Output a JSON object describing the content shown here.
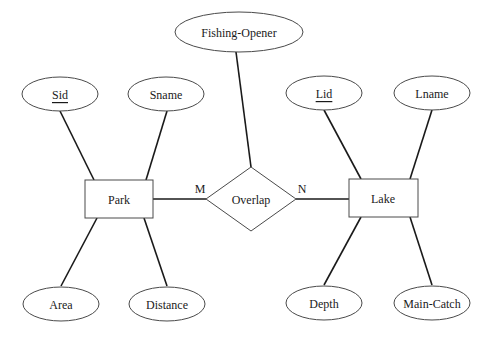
{
  "diagram": {
    "type": "er-diagram",
    "entities": [
      {
        "id": "park",
        "label": "Park"
      },
      {
        "id": "lake",
        "label": "Lake"
      }
    ],
    "relationships": [
      {
        "id": "overlap",
        "label": "Overlap",
        "left_cardinality": "M",
        "right_cardinality": "N"
      }
    ],
    "attributes": {
      "fishing_opener": {
        "label": "Fishing-Opener",
        "owner": "overlap",
        "key": false
      },
      "sid": {
        "label": "Sid",
        "owner": "park",
        "key": true
      },
      "sname": {
        "label": "Sname",
        "owner": "park",
        "key": false
      },
      "area": {
        "label": "Area",
        "owner": "park",
        "key": false
      },
      "distance": {
        "label": "Distance",
        "owner": "park",
        "key": false
      },
      "lid": {
        "label": "Lid",
        "owner": "lake",
        "key": true
      },
      "lname": {
        "label": "Lname",
        "owner": "lake",
        "key": false
      },
      "depth": {
        "label": "Depth",
        "owner": "lake",
        "key": false
      },
      "main_catch": {
        "label": "Main-Catch",
        "owner": "lake",
        "key": false
      }
    },
    "colors": {
      "stroke": "#4a4a4a",
      "text": "#1a1a1a",
      "background": "#ffffff"
    }
  }
}
